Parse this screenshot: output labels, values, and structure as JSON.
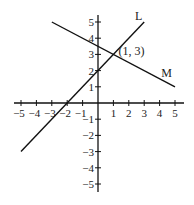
{
  "chart_data": {
    "type": "line",
    "title": "",
    "xlabel": "",
    "ylabel": "",
    "xlim": [
      -5,
      5
    ],
    "ylim": [
      -5,
      5
    ],
    "grid": false,
    "x_ticks": [
      -5,
      -4,
      -3,
      -2,
      -1,
      1,
      2,
      3,
      4,
      5
    ],
    "x_tick_labels": [
      "−5",
      "−4",
      "−3",
      "−2",
      "−1",
      "1",
      "2",
      "3",
      "4",
      "5"
    ],
    "y_ticks": [
      5,
      4,
      3,
      2,
      1,
      -1,
      -2,
      -3,
      -4,
      -5
    ],
    "y_tick_labels": [
      "5",
      "4",
      "3",
      "2",
      "1",
      "−1",
      "−2",
      "−3",
      "−4",
      "−5"
    ],
    "series": [
      {
        "name": "L",
        "equation": "y = x + 2",
        "points": [
          [
            -5,
            -3
          ],
          [
            3,
            5
          ]
        ]
      },
      {
        "name": "M",
        "equation": "y = -0.5x + 3.5",
        "points": [
          [
            -3,
            5
          ],
          [
            5,
            1
          ]
        ]
      }
    ],
    "annotations": [
      {
        "text": "(1, 3)",
        "x": 1,
        "y": 3
      }
    ]
  }
}
